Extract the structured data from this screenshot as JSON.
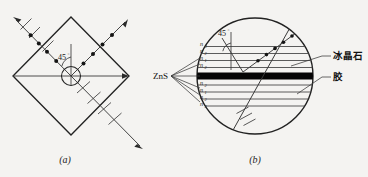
{
  "figure": {
    "background_color": "#f4f3f1",
    "ink_color": "#222222",
    "panels": [
      {
        "id": "a",
        "caption": "(a)",
        "shape": "diamond",
        "angle_label": "45",
        "angle_unit": "°",
        "description_items": [
          "incident-ray-arrow",
          "reflected-ray-arrow",
          "transmitted-ray-arrow",
          "polarization-dots",
          "polarization-ticks",
          "center-circle"
        ]
      },
      {
        "id": "b",
        "caption": "(b)",
        "shape": "circle",
        "angle_label": "45",
        "angle_unit": "°",
        "material_label": "ZnS",
        "callouts": [
          {
            "key": "cryolite",
            "text": "冰晶石"
          },
          {
            "key": "glue",
            "text": "胶"
          }
        ],
        "layer_labels_top": [
          "n",
          "n",
          "n",
          "n"
        ],
        "layer_labels_bottom": [
          "n",
          "n",
          "n",
          "n"
        ],
        "layer_subscripts_top": [
          "3",
          "2",
          "1",
          "2"
        ],
        "layer_subscripts_bottom": [
          "2",
          "1",
          "2",
          "3"
        ],
        "band_color": "#000000"
      }
    ]
  }
}
